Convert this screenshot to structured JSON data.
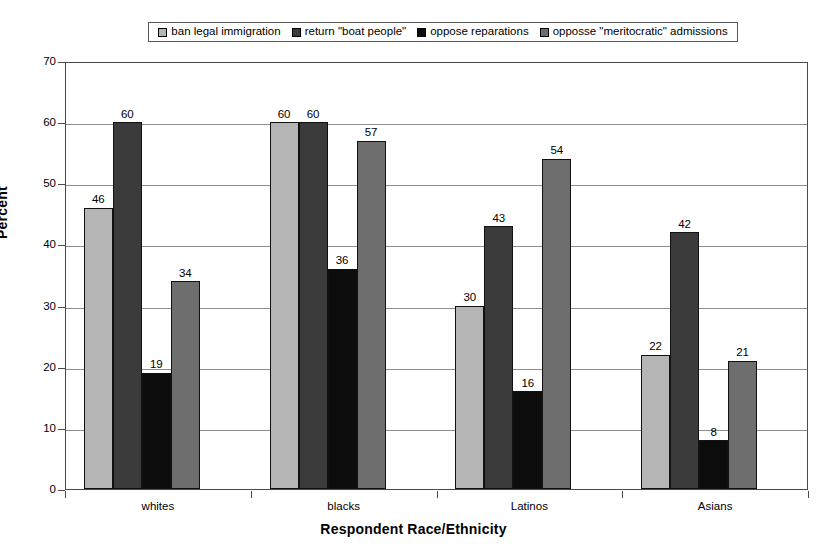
{
  "chart_data": {
    "type": "bar",
    "title": "",
    "xlabel": "Respondent Race/Ethnicity",
    "ylabel": "Percent",
    "ylim": [
      0,
      70
    ],
    "ytick_step": 10,
    "yticks": [
      0,
      10,
      20,
      30,
      40,
      50,
      60,
      70
    ],
    "grid": true,
    "legend_position": "top",
    "categories": [
      "whites",
      "blacks",
      "Latinos",
      "Asians"
    ],
    "series": [
      {
        "name": "ban legal immigration",
        "color": "#b5b5b5",
        "values": [
          46,
          60,
          30,
          22
        ]
      },
      {
        "name": "return \"boat people\"",
        "color": "#3b3b3b",
        "values": [
          60,
          60,
          43,
          42
        ]
      },
      {
        "name": "oppose reparations",
        "color": "#0c0c0c",
        "values": [
          19,
          36,
          16,
          8
        ]
      },
      {
        "name": "opposse \"meritocratic\" admissions",
        "color": "#6e6e6e",
        "values": [
          34,
          57,
          54,
          21
        ]
      }
    ]
  },
  "legend": {
    "entries": [
      {
        "label": "ban legal immigration",
        "swatch": "legend-swatch-series-1"
      },
      {
        "label": "return \"boat people\"",
        "swatch": "legend-swatch-series-2"
      },
      {
        "label": "oppose reparations",
        "swatch": "legend-swatch-series-3"
      },
      {
        "label": "opposse \"meritocratic\" admissions",
        "swatch": "legend-swatch-series-4"
      }
    ]
  },
  "axes": {
    "y_title": "Percent",
    "x_title": "Respondent Race/Ethnicity",
    "y_tick_labels": [
      "70",
      "60",
      "50",
      "40",
      "30",
      "20",
      "10",
      "0"
    ],
    "x_tick_labels": [
      "whites",
      "blacks",
      "Latinos",
      "Asians"
    ]
  }
}
